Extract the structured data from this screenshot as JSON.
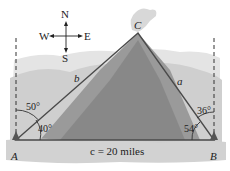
{
  "compass": {
    "n": "N",
    "s": "S",
    "e": "E",
    "w": "W"
  },
  "vertices": {
    "a": "A",
    "b": "B",
    "c": "C"
  },
  "sides": {
    "a": "a",
    "b": "b",
    "c": "c = 20 miles"
  },
  "angles": {
    "a_from_north": "50°",
    "a_interior": "40°",
    "b_from_north": "36°",
    "b_interior": "54°"
  },
  "colors": {
    "line": "#4a4a4a",
    "terrain_dark": "#8f8f8f",
    "terrain_light": "#c9c9c9",
    "sky": "#ffffff"
  }
}
